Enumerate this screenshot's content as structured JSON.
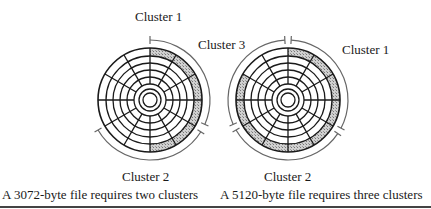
{
  "figure": {
    "left": {
      "labels": {
        "cluster1": "Cluster 1",
        "cluster2": "Cluster 2",
        "cluster3": "Cluster  3"
      },
      "caption": "A 3072-byte file requires two clusters",
      "shaded_outer_sectors": [
        0,
        1,
        2,
        3,
        4,
        5
      ]
    },
    "right": {
      "labels": {
        "cluster1": "Cluster 1",
        "cluster2": "Cluster 2"
      },
      "caption": "A 5120-byte file requires three clusters",
      "shaded_outer_sectors": [
        0,
        1,
        2,
        3,
        4,
        5,
        6,
        7,
        8,
        9
      ]
    },
    "disk": {
      "sectors": 12,
      "tracks": 5,
      "shade_color": "#b8b8b8",
      "line_color": "#1a1a1a"
    }
  }
}
